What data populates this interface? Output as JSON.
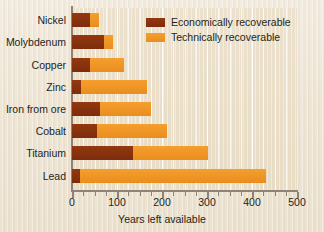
{
  "chart_data": {
    "type": "bar",
    "orientation": "horizontal",
    "stacked": true,
    "title": "",
    "xlabel": "Years left available",
    "ylabel": "",
    "xlim": [
      0,
      500
    ],
    "xticks": [
      0,
      100,
      200,
      300,
      400,
      500
    ],
    "xtick_labels": [
      "0",
      "100",
      "200",
      "300",
      "400",
      "500"
    ],
    "minor_tick_interval": 25,
    "grid": true,
    "grid_axis": "x",
    "legend_position": "upper right",
    "categories": [
      "Nickel",
      "Molybdenum",
      "Copper",
      "Zinc",
      "Iron from ore",
      "Cobalt",
      "Titanium",
      "Lead"
    ],
    "series": [
      {
        "name": "Economically recoverable",
        "color": "#8c3310",
        "values": [
          40,
          72,
          40,
          20,
          63,
          55,
          135,
          18
        ]
      },
      {
        "name": "Technically recoverable",
        "color": "#f0982a",
        "values": [
          60,
          90,
          115,
          167,
          175,
          210,
          302,
          430
        ]
      }
    ]
  },
  "legend": {
    "items": [
      {
        "label": "Economically recoverable",
        "color": "#8c3310"
      },
      {
        "label": "Technically recoverable",
        "color": "#f0982a"
      }
    ]
  },
  "axis": {
    "x_title": "Years left available"
  }
}
